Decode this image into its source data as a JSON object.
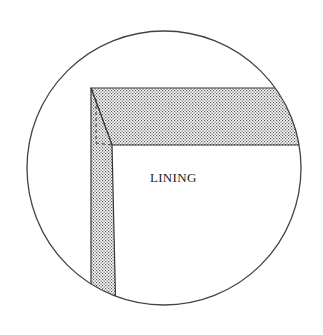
{
  "diagram": {
    "label": "LINING",
    "colors": {
      "stroke": "#333333",
      "fill_pattern": "#555555",
      "background": "#ffffff"
    },
    "circle": {
      "cx": 164,
      "cy": 168,
      "r": 137
    },
    "elements": [
      "circular-detail-view",
      "horizontal-hem-band",
      "vertical-hem-band",
      "mitered-corner",
      "lining-area"
    ]
  }
}
